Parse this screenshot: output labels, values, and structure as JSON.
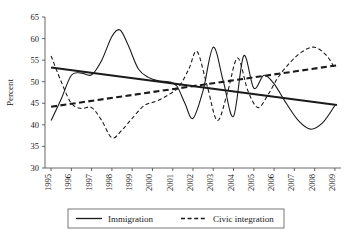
{
  "chart_data": {
    "type": "line",
    "title": "",
    "xlabel": "",
    "ylabel": "Percent",
    "xlim": [
      1994.7,
      2009.3
    ],
    "ylim": [
      30,
      65
    ],
    "ytick_step": 5,
    "grid": false,
    "legend_position": "bottom",
    "categories": [
      "1995",
      "1996",
      "1997",
      "1998",
      "1999",
      "2000",
      "2001",
      "2002",
      "2003",
      "2004",
      "2005",
      "2006",
      "2007",
      "2008",
      "2009"
    ],
    "yticks": [
      "30",
      "35",
      "40",
      "45",
      "50",
      "55",
      "60",
      "65"
    ],
    "series": [
      {
        "name": "Immigration",
        "style": "solid",
        "x": [
          1995.0,
          1995.5,
          1996.0,
          1996.5,
          1997.0,
          1997.5,
          1998.0,
          1998.4,
          1998.8,
          1999.3,
          1999.8,
          2000.3,
          2000.8,
          2001.2,
          2001.6,
          2002.0,
          2002.5,
          2003.0,
          2003.5,
          2004.0,
          2004.5,
          2005.0,
          2005.5,
          2006.0,
          2006.6,
          2007.2,
          2007.8,
          2008.4,
          2009.0
        ],
        "values": [
          41.0,
          46.0,
          51.5,
          52.0,
          51.6,
          55.0,
          60.5,
          62.0,
          58.5,
          53.0,
          51.0,
          50.2,
          50.0,
          49.0,
          45.0,
          41.5,
          48.0,
          58.0,
          50.0,
          42.0,
          56.0,
          48.5,
          51.5,
          49.5,
          45.0,
          41.0,
          39.0,
          40.5,
          44.5
        ]
      },
      {
        "name": "Civic integration",
        "style": "dashed",
        "x": [
          1995.0,
          1995.5,
          1996.0,
          1996.5,
          1997.0,
          1997.5,
          1998.0,
          1998.5,
          1999.0,
          1999.6,
          2000.2,
          2000.8,
          2001.3,
          2001.8,
          2002.2,
          2002.7,
          2003.2,
          2003.7,
          2004.2,
          2004.7,
          2005.2,
          2005.7,
          2006.2,
          2006.8,
          2007.4,
          2008.0,
          2008.6,
          2009.0
        ],
        "values": [
          56.0,
          50.0,
          45.0,
          43.8,
          44.0,
          41.0,
          37.0,
          38.8,
          41.5,
          44.5,
          45.5,
          47.0,
          48.8,
          53.0,
          57.0,
          49.0,
          41.0,
          47.5,
          55.5,
          48.0,
          44.0,
          47.0,
          51.0,
          54.5,
          57.0,
          58.0,
          56.0,
          53.0
        ]
      }
    ],
    "trendlines": [
      {
        "name": "Immigration trend",
        "style": "solid",
        "x": [
          1995.0,
          2009.1
        ],
        "values": [
          53.3,
          44.6
        ]
      },
      {
        "name": "Civic integration trend",
        "style": "dashed",
        "x": [
          1995.0,
          2009.1
        ],
        "values": [
          44.2,
          53.8
        ]
      }
    ]
  },
  "legend": {
    "items": [
      {
        "label": "Immigration",
        "style": "solid"
      },
      {
        "label": "Civic integration",
        "style": "dashed"
      }
    ]
  }
}
